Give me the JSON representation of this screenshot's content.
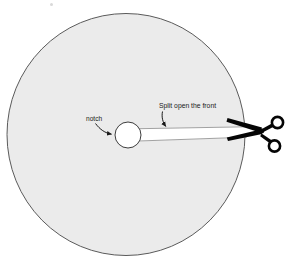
{
  "figure": {
    "background_color": "#ffffff",
    "disc": {
      "name": "paper-disc",
      "fill_color": "#ebebeb",
      "stroke_color": "#5a5a5a",
      "stroke_width": 1,
      "center_x": 126,
      "center_y": 134.5,
      "radius_x": 119,
      "radius_y": 121
    },
    "notch_hole": {
      "name": "center-notch-hole",
      "fill_color": "#ffffff",
      "stroke_color": "#3d3d3d",
      "stroke_width": 1,
      "center_x": 128,
      "center_y": 135,
      "radius": 13
    },
    "cut_slit": {
      "name": "split-cut-wedge",
      "fill_color": "#ffffff",
      "stroke_color": "#7a7a7a",
      "stroke_width": 0.8,
      "from_x": 140,
      "from_y": 133,
      "to_x": 247,
      "to_y": 131,
      "mouth_height": 7
    },
    "scissors": {
      "name": "scissors",
      "color": "#050505",
      "pivot_x": 258,
      "pivot_y": 132,
      "blade_tip_x": 228,
      "blade_tip_y": 120
    },
    "speck": {
      "name": "stray-speck",
      "color": "#d9d9d9",
      "x": 50,
      "y": 3
    }
  },
  "annotations": {
    "notch": {
      "label": "notch",
      "name": "notch-label",
      "text_x": 86,
      "text_y": 116,
      "arrow_from_x": 96,
      "arrow_from_y": 124,
      "arrow_to_x": 114,
      "arrow_to_y": 134,
      "color": "#1a1a1a"
    },
    "split": {
      "label": "Split open the front",
      "name": "split-open-the-front-label",
      "text_x": 159,
      "text_y": 103,
      "arrow_from_x": 163,
      "arrow_from_y": 112,
      "arrow_to_x": 167,
      "arrow_to_y": 129,
      "color": "#1a1a1a"
    }
  }
}
